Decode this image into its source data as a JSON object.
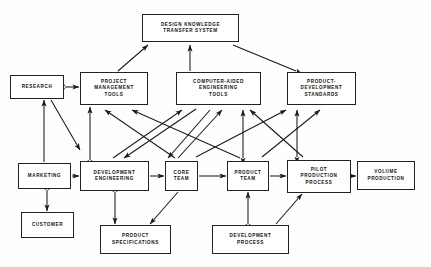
{
  "diagram": {
    "background_color": "#fefefe",
    "line_color": "#1a1a1a",
    "box_border_color": "#222222",
    "nodes": [
      {
        "id": "design_knowledge_transfer_system",
        "label": "DESIGN KNOWLEDGE\nTRANSFER SYSTEM",
        "x": 142,
        "y": 14,
        "w": 97,
        "h": 28
      },
      {
        "id": "research",
        "label": "RESEARCH",
        "x": 10,
        "y": 75,
        "w": 54,
        "h": 24
      },
      {
        "id": "project_management_tools",
        "label": "PROJECT\nMANAGEMENT\nTOOLS",
        "x": 80,
        "y": 72,
        "w": 68,
        "h": 33
      },
      {
        "id": "computer_aided_engineering_tools",
        "label": "COMPUTER-AIDED\nENGINEERING\nTOOLS",
        "x": 176,
        "y": 72,
        "w": 85,
        "h": 33
      },
      {
        "id": "product_development_standards",
        "label": "PRODUCT-\nDEVELOPMENT\nSTANDARDS",
        "x": 287,
        "y": 72,
        "w": 69,
        "h": 33
      },
      {
        "id": "marketing",
        "label": "MARKETING",
        "x": 18,
        "y": 163,
        "w": 53,
        "h": 26
      },
      {
        "id": "development_engineering",
        "label": "DEVELOPMENT\nENGINEERING",
        "x": 80,
        "y": 161,
        "w": 69,
        "h": 30
      },
      {
        "id": "core_team",
        "label": "CORE\nTEAM",
        "x": 165,
        "y": 161,
        "w": 33,
        "h": 30
      },
      {
        "id": "product_team",
        "label": "PRODUCT\nTEAM",
        "x": 227,
        "y": 161,
        "w": 42,
        "h": 30
      },
      {
        "id": "pilot_production_process",
        "label": "PILOT\nPRODUCTION\nPROCESS",
        "x": 287,
        "y": 160,
        "w": 64,
        "h": 33
      },
      {
        "id": "volume_production",
        "label": "VOLUME\nPRODUCTION",
        "x": 357,
        "y": 161,
        "w": 58,
        "h": 29
      },
      {
        "id": "customer",
        "label": "CUSTOMER",
        "x": 21,
        "y": 212,
        "w": 53,
        "h": 26
      },
      {
        "id": "product_specifications",
        "label": "PRODUCT\nSPECIFICATIONS",
        "x": 100,
        "y": 225,
        "w": 71,
        "h": 29
      },
      {
        "id": "development_process",
        "label": "DEVELOPMENT\nPROCESS",
        "x": 212,
        "y": 225,
        "w": 77,
        "h": 29
      }
    ],
    "edges": [
      {
        "from": "project_management_tools",
        "to": "design_knowledge_transfer_system",
        "x1": 118,
        "y1": 71,
        "x2": 148,
        "y2": 45,
        "arrow": "end"
      },
      {
        "from": "computer_aided_engineering_tools",
        "to": "design_knowledge_transfer_system",
        "x1": 190,
        "y1": 71,
        "x2": 190,
        "y2": 45,
        "arrow": "end"
      },
      {
        "from": "product_development_standards",
        "to": "design_knowledge_transfer_system",
        "x1": 296,
        "y1": 71,
        "x2": 233,
        "y2": 45,
        "arrow": "start"
      },
      {
        "from": "research",
        "to": "project_management_tools",
        "x1": 65,
        "y1": 87,
        "x2": 79,
        "y2": 87,
        "arrow": "both"
      },
      {
        "from": "marketing",
        "to": "research",
        "x1": 44,
        "y1": 162,
        "x2": 44,
        "y2": 100,
        "arrow": "end"
      },
      {
        "from": "research",
        "to": "development_engineering",
        "x1": 51,
        "y1": 100,
        "x2": 80,
        "y2": 150,
        "arrow": "end"
      },
      {
        "from": "development_engineering",
        "to": "project_management_tools",
        "x1": 90,
        "y1": 160,
        "x2": 90,
        "y2": 107,
        "arrow": "both"
      },
      {
        "from": "development_engineering",
        "to": "computer_aided_engineering_tools",
        "x1": 113,
        "y1": 158,
        "x2": 182,
        "y2": 110,
        "arrow": "end"
      },
      {
        "from": "computer_aided_engineering_tools",
        "to": "development_engineering",
        "x1": 196,
        "y1": 109,
        "x2": 124,
        "y2": 158,
        "arrow": "end"
      },
      {
        "from": "core_team",
        "to": "project_management_tools",
        "x1": 175,
        "y1": 158,
        "x2": 105,
        "y2": 110,
        "arrow": "end"
      },
      {
        "from": "product_team",
        "to": "project_management_tools",
        "x1": 240,
        "y1": 158,
        "x2": 132,
        "y2": 110,
        "arrow": "end"
      },
      {
        "from": "core_team",
        "to": "computer_aided_engineering_tools",
        "x1": 178,
        "y1": 158,
        "x2": 222,
        "y2": 110,
        "arrow": "end"
      },
      {
        "from": "computer_aided_engineering_tools",
        "to": "core_team",
        "x1": 210,
        "y1": 110,
        "x2": 168,
        "y2": 158,
        "arrow": "end"
      },
      {
        "from": "product_team",
        "to": "computer_aided_engineering_tools",
        "x1": 243,
        "y1": 158,
        "x2": 243,
        "y2": 110,
        "arrow": "both"
      },
      {
        "from": "pilot_production_process",
        "to": "computer_aided_engineering_tools",
        "x1": 303,
        "y1": 157,
        "x2": 250,
        "y2": 110,
        "arrow": "end"
      },
      {
        "from": "pilot_production_process",
        "to": "product_development_standards",
        "x1": 297,
        "y1": 157,
        "x2": 297,
        "y2": 110,
        "arrow": "both"
      },
      {
        "from": "product_team",
        "to": "product_development_standards",
        "x1": 262,
        "y1": 157,
        "x2": 320,
        "y2": 110,
        "arrow": "end"
      },
      {
        "from": "core_team",
        "to": "product_development_standards",
        "x1": 196,
        "y1": 157,
        "x2": 286,
        "y2": 110,
        "arrow": "end"
      },
      {
        "from": "marketing",
        "to": "development_engineering",
        "x1": 72,
        "y1": 176,
        "x2": 79,
        "y2": 176,
        "arrow": "end"
      },
      {
        "from": "development_engineering",
        "to": "core_team",
        "x1": 150,
        "y1": 176,
        "x2": 164,
        "y2": 176,
        "arrow": "end"
      },
      {
        "from": "core_team",
        "to": "product_team",
        "x1": 199,
        "y1": 176,
        "x2": 226,
        "y2": 176,
        "arrow": "end"
      },
      {
        "from": "product_team",
        "to": "pilot_production_process",
        "x1": 270,
        "y1": 176,
        "x2": 286,
        "y2": 176,
        "arrow": "end"
      },
      {
        "from": "pilot_production_process",
        "to": "volume_production",
        "x1": 352,
        "y1": 176,
        "x2": 356,
        "y2": 176,
        "arrow": "end"
      },
      {
        "from": "marketing",
        "to": "customer",
        "x1": 47,
        "y1": 190,
        "x2": 47,
        "y2": 211,
        "arrow": "both"
      },
      {
        "from": "development_engineering",
        "to": "product_specifications",
        "x1": 115,
        "y1": 192,
        "x2": 115,
        "y2": 224,
        "arrow": "both"
      },
      {
        "from": "core_team",
        "to": "product_specifications",
        "x1": 178,
        "y1": 192,
        "x2": 150,
        "y2": 224,
        "arrow": "end"
      },
      {
        "from": "development_process",
        "to": "product_team",
        "x1": 248,
        "y1": 224,
        "x2": 248,
        "y2": 192,
        "arrow": "both"
      },
      {
        "from": "development_process",
        "to": "pilot_production_process",
        "x1": 276,
        "y1": 224,
        "x2": 302,
        "y2": 194,
        "arrow": "end"
      }
    ]
  }
}
